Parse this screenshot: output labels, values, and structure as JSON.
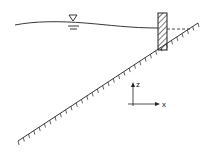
{
  "diagram": {
    "water_surface_symbol": "water-level-triangle",
    "axes": {
      "z_label": "z",
      "x_label": "x"
    },
    "colors": {
      "line": "#222222",
      "background": "#ffffff"
    }
  }
}
